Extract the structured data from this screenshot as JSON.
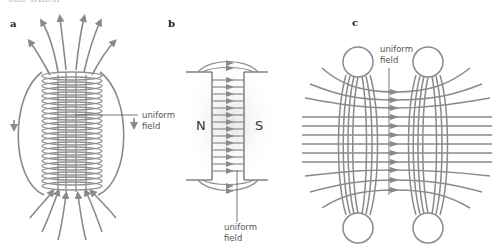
{
  "figure": {
    "top_caption_fragment": "one which",
    "panels": [
      {
        "id": "a",
        "label": "a",
        "description": "Solenoid with field lines",
        "annotation": {
          "line1": "uniform",
          "line2": "field"
        }
      },
      {
        "id": "b",
        "label": "b",
        "description": "Gap between N and S magnet poles",
        "poles": {
          "left": "N",
          "right": "S"
        },
        "annotation": {
          "line1": "uniform",
          "line2": "field"
        }
      },
      {
        "id": "c",
        "label": "c",
        "description": "Pair of coils (Helmholtz) with field lines",
        "annotation": {
          "line1": "uniform",
          "line2": "field"
        }
      }
    ],
    "colors": {
      "line": "#8a8a8a",
      "coil": "#8f8f8f",
      "text": "#555555",
      "label": "#222222",
      "shade": "#e6e6e6"
    }
  }
}
